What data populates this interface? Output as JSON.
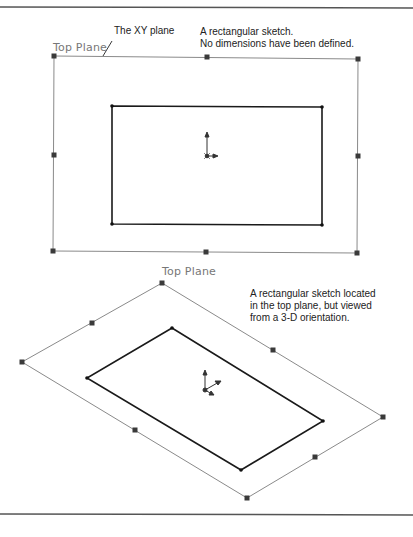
{
  "top_view": {
    "plane_label": "Top Plane",
    "callout_xy": "The XY plane",
    "callout_sketch_line1": "A rectangular sketch.",
    "callout_sketch_line2": "No dimensions have been defined."
  },
  "iso_view": {
    "plane_label": "Top Plane",
    "callout_line1": "A rectangular sketch located",
    "callout_line2": "in the top plane, but viewed",
    "callout_line3": "from a 3-D orientation."
  },
  "colors": {
    "plane_border": "#8a8a8a",
    "sketch_line": "#1a1a1a",
    "handle": "#3a3a3a",
    "rule": "#555555"
  }
}
